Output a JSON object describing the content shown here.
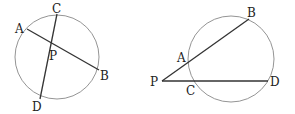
{
  "figures": [
    {
      "name": "intersecting-chords",
      "labels": {
        "A": "A",
        "B": "B",
        "C": "C",
        "D": "D",
        "P": "P"
      }
    },
    {
      "name": "intersecting-secants",
      "labels": {
        "A": "A",
        "B": "B",
        "C": "C",
        "D": "D",
        "P": "P"
      }
    }
  ],
  "colors": {
    "circle": "#888888",
    "line": "#333333",
    "text": "#222222"
  }
}
